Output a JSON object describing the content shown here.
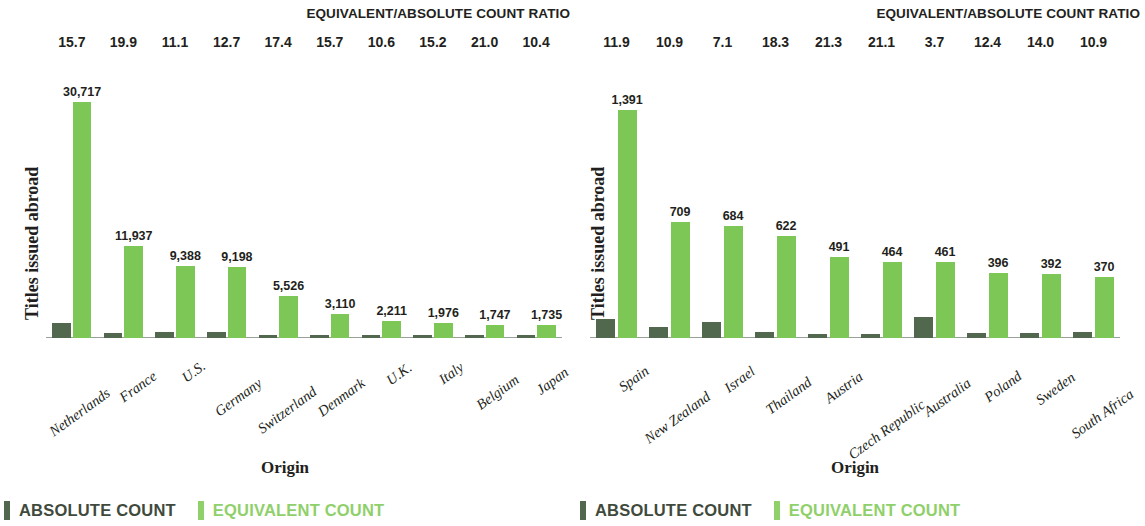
{
  "colors": {
    "absolute": "#51674e",
    "equivalent": "#7cc756",
    "equivalent_legend": "#8fd06a",
    "text": "#231f20",
    "baseline": "#9aa09a"
  },
  "legend": {
    "absolute_label": "ABSOLUTE COUNT",
    "equivalent_label": "EQUIVALENT COUNT"
  },
  "panels": [
    {
      "id": "left",
      "ratio_header": "EQUIVALENT/ABSOLUTE COUNT RATIO",
      "ylabel": "Titles issued abroad",
      "xlabel": "Origin"
    },
    {
      "id": "right",
      "ratio_header": "EQUIVALENT/ABSOLUTE COUNT RATIO",
      "ylabel": "Titles issued abroad",
      "xlabel": "Origin"
    }
  ],
  "chart_data": [
    {
      "type": "bar",
      "title": "EQUIVALENT/ABSOLUTE COUNT RATIO",
      "xlabel": "Origin",
      "ylabel": "Titles issued abroad",
      "ylim": [
        0,
        31000
      ],
      "grid": false,
      "legend_position": "bottom-left",
      "categories": [
        "Netherlands",
        "France",
        "U.S.",
        "Germany",
        "Switzerland",
        "Denmark",
        "U.K.",
        "Italy",
        "Belgium",
        "Japan"
      ],
      "ratios": [
        "15.7",
        "19.9",
        "11.1",
        "12.7",
        "17.4",
        "15.7",
        "10.6",
        "15.2",
        "21.0",
        "10.4"
      ],
      "series": [
        {
          "name": "ABSOLUTE COUNT",
          "values": [
            1956,
            600,
            846,
            724,
            318,
            201,
            209,
            130,
            83,
            167
          ],
          "labels": [
            "",
            "",
            "",
            "",
            "",
            "",
            "",
            "",
            "",
            ""
          ]
        },
        {
          "name": "EQUIVALENT COUNT",
          "values": [
            30717,
            11937,
            9388,
            9198,
            5526,
            3110,
            2211,
            1976,
            1747,
            1735
          ],
          "labels": [
            "30,717",
            "11,937",
            "9,388",
            "9,198",
            "5,526",
            "3,110",
            "2,211",
            "1,976",
            "1,747",
            "1,735"
          ]
        }
      ]
    },
    {
      "type": "bar",
      "title": "EQUIVALENT/ABSOLUTE COUNT RATIO",
      "xlabel": "Origin",
      "ylabel": "Titles issued abroad",
      "ylim": [
        0,
        1450
      ],
      "grid": false,
      "legend_position": "bottom-left",
      "categories": [
        "Spain",
        "New Zealand",
        "Israel",
        "Thailand",
        "Austria",
        "Czech Republic",
        "Australia",
        "Poland",
        "Sweden",
        "South Africa"
      ],
      "ratios": [
        "11.9",
        "10.9",
        "7.1",
        "18.3",
        "21.3",
        "21.1",
        "3.7",
        "12.4",
        "14.0",
        "10.9"
      ],
      "series": [
        {
          "name": "ABSOLUTE COUNT",
          "values": [
            117,
            65,
            96,
            34,
            23,
            22,
            125,
            32,
            28,
            34
          ],
          "labels": [
            "",
            "",
            "",
            "",
            "",
            "",
            "",
            "",
            "",
            ""
          ]
        },
        {
          "name": "EQUIVALENT COUNT",
          "values": [
            1391,
            709,
            684,
            622,
            491,
            464,
            461,
            396,
            392,
            370
          ],
          "labels": [
            "1,391",
            "709",
            "684",
            "622",
            "491",
            "464",
            "461",
            "396",
            "392",
            "370"
          ]
        }
      ]
    }
  ]
}
